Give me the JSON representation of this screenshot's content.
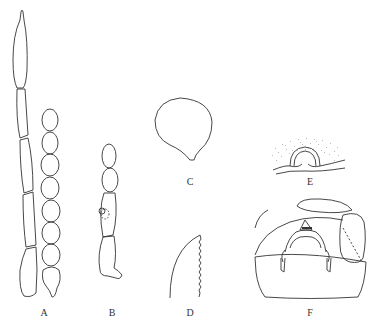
{
  "figure": {
    "panels": [
      {
        "id": "A",
        "label": "A",
        "description": "two antennae: elongate segmented and moniliform"
      },
      {
        "id": "B",
        "label": "B",
        "description": "short antenna with basal hook and sensory pit"
      },
      {
        "id": "C",
        "label": "C",
        "description": "rounded bulb with short stalk"
      },
      {
        "id": "D",
        "label": "D",
        "description": "blade with serrated edge"
      },
      {
        "id": "E",
        "label": "E",
        "description": "dome structure with stippled area above"
      },
      {
        "id": "F",
        "label": "F",
        "description": "genital capsule / terminal segment view"
      }
    ],
    "colors": {
      "stroke": "#333333",
      "background": "#ffffff"
    }
  }
}
